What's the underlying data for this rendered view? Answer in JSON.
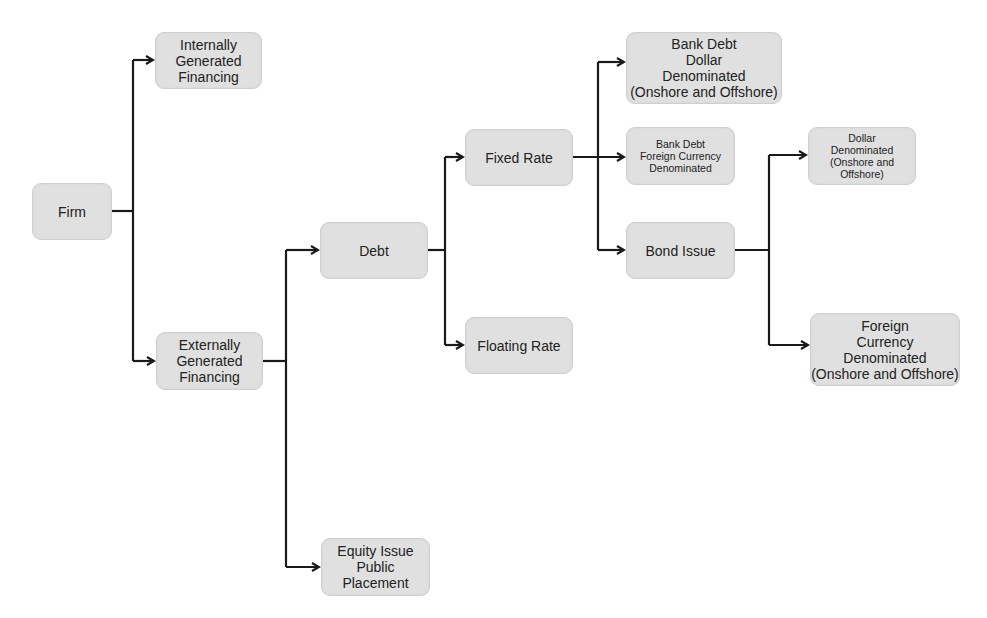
{
  "diagram": {
    "type": "tree / flowchart",
    "nodes": {
      "firm": "Firm",
      "internal": "Internally\nGenerated\nFinancing",
      "external": "Externally\nGenerated\nFinancing",
      "debt": "Debt",
      "equity": "Equity Issue\nPublic\nPlacement",
      "fixed": "Fixed Rate",
      "floating": "Floating Rate",
      "bank_dollar": "Bank Debt\nDollar\nDenominated\n(Onshore and Offshore)",
      "bank_foreign": "Bank Debt\nForeign Currency\nDenominated",
      "bond": "Bond Issue",
      "bond_dollar": "Dollar\nDenominated\n(Onshore and\nOffshore)",
      "bond_foreign": "Foreign\nCurrency\nDenominated\n(Onshore and Offshore)"
    },
    "edges": [
      [
        "firm",
        "internal"
      ],
      [
        "firm",
        "external"
      ],
      [
        "external",
        "debt"
      ],
      [
        "external",
        "equity"
      ],
      [
        "debt",
        "fixed"
      ],
      [
        "debt",
        "floating"
      ],
      [
        "fixed",
        "bank_dollar"
      ],
      [
        "fixed",
        "bank_foreign"
      ],
      [
        "fixed",
        "bond"
      ],
      [
        "bond",
        "bond_dollar"
      ],
      [
        "bond",
        "bond_foreign"
      ]
    ],
    "colors": {
      "node_fill": "#e0e0e0",
      "node_border": "#cfcfcf",
      "connector": "#1a1a1a",
      "text": "#222222"
    }
  }
}
